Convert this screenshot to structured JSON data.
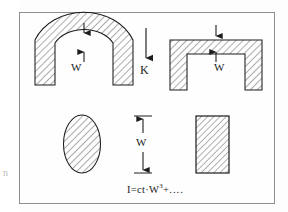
{
  "figure": {
    "name": "beam-stiffness-cross-sections-diagram",
    "border_color": "#8e8e8e",
    "ink_color": "#1c1c1c",
    "hatch_color": "#3a3a3a",
    "background": "#fefefe"
  },
  "labels": {
    "arch_thickness": "W",
    "portal_thickness": "W",
    "load_symbol": "K",
    "dimension_height": "W"
  },
  "formula": {
    "lhs": "I",
    "equals": "=",
    "coefficient": "ct",
    "dot": "·",
    "variable": "W",
    "exponent": "3",
    "plus": "+",
    "ellipsis": "...."
  },
  "shapes": [
    {
      "name": "arch-section",
      "type": "semicircular-annulus",
      "position": "top-left",
      "hatched": true,
      "dimension_label": "W"
    },
    {
      "name": "portal-section",
      "type": "inverted-u-frame",
      "position": "top-right",
      "hatched": true,
      "dimension_label": "W"
    },
    {
      "name": "ellipse-section",
      "type": "ellipse",
      "position": "bottom-left",
      "hatched": true
    },
    {
      "name": "rectangle-section",
      "type": "rectangle",
      "position": "bottom-right",
      "hatched": true
    }
  ],
  "annotations": {
    "load_arrow": "downward-arrow",
    "dimension_arrow": "double-headed-vertical-arrow",
    "margin_artifact": "n"
  }
}
